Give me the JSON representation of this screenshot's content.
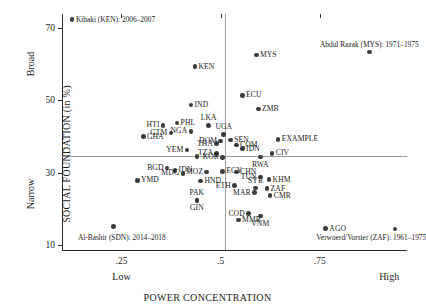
{
  "chart_data": {
    "type": "scatter",
    "title": "",
    "xlabel": "POWER CONCENTRATION",
    "ylabel": "SOCIAL FOUNDATION (in %)",
    "xlim": [
      0.1,
      0.97
    ],
    "ylim": [
      8.5,
      74.0
    ],
    "xticks": [
      ".25",
      ".5",
      ".75"
    ],
    "xtick_values": [
      0.25,
      0.5,
      0.75
    ],
    "yticks": [
      "10",
      "30",
      "50",
      "70"
    ],
    "ytick_values": [
      10,
      30,
      50,
      70
    ],
    "grid": false,
    "legend": "none",
    "x_axis_low_label": "Low",
    "x_axis_high_label": "High",
    "y_axis_low_label": "Narrow",
    "y_axis_high_label": "Broad",
    "reference_lines": {
      "vertical_x": 0.51,
      "horizontal_y": 34.5
    },
    "points": [
      {
        "label": "",
        "x": 0.125,
        "y": 72.4,
        "pos": "none"
      },
      {
        "label": "KEN",
        "x": 0.435,
        "y": 59.4,
        "pos": "right"
      },
      {
        "label": "MYS",
        "x": 0.59,
        "y": 62.6,
        "pos": "right"
      },
      {
        "label": "",
        "x": 0.875,
        "y": 63.4,
        "pos": "none"
      },
      {
        "label": "ECU",
        "x": 0.555,
        "y": 51.4,
        "pos": "right"
      },
      {
        "label": "IND",
        "x": 0.425,
        "y": 48.7,
        "pos": "right"
      },
      {
        "label": "ZMB",
        "x": 0.595,
        "y": 47.6,
        "pos": "right"
      },
      {
        "label": "PHL",
        "x": 0.39,
        "y": 43.8,
        "pos": "right"
      },
      {
        "label": "HTI",
        "x": 0.355,
        "y": 43.1,
        "pos": "left"
      },
      {
        "label": "LKA",
        "x": 0.47,
        "y": 43.0,
        "pos": "top"
      },
      {
        "label": "GTM",
        "x": 0.375,
        "y": 41.0,
        "pos": "left"
      },
      {
        "label": "NGA",
        "x": 0.425,
        "y": 41.4,
        "pos": "left"
      },
      {
        "label": "UGA",
        "x": 0.508,
        "y": 40.5,
        "pos": "top"
      },
      {
        "label": "GHA",
        "x": 0.305,
        "y": 40.0,
        "pos": "right"
      },
      {
        "label": "DOM",
        "x": 0.5,
        "y": 38.7,
        "pos": "left"
      },
      {
        "label": "SEN",
        "x": 0.525,
        "y": 39.0,
        "pos": "right"
      },
      {
        "label": "THA",
        "x": 0.49,
        "y": 38.0,
        "pos": "left"
      },
      {
        "label": "COM",
        "x": 0.54,
        "y": 37.6,
        "pos": "right"
      },
      {
        "label": "EXAMPLE",
        "x": 0.645,
        "y": 39.2,
        "pos": "right"
      },
      {
        "label": "IDN",
        "x": 0.555,
        "y": 36.6,
        "pos": "right"
      },
      {
        "label": "YEM",
        "x": 0.415,
        "y": 36.2,
        "pos": "left"
      },
      {
        "label": "TZA",
        "x": 0.49,
        "y": 35.3,
        "pos": "left"
      },
      {
        "label": "CIV",
        "x": 0.63,
        "y": 35.3,
        "pos": "right"
      },
      {
        "label": "KOR",
        "x": 0.505,
        "y": 34.2,
        "pos": "left"
      },
      {
        "label": "RWA",
        "x": 0.6,
        "y": 34.3,
        "pos": "bottom"
      },
      {
        "label": "",
        "x": 0.44,
        "y": 34.4,
        "pos": "none"
      },
      {
        "label": "BGD",
        "x": 0.365,
        "y": 31.3,
        "pos": "left"
      },
      {
        "label": "IDN",
        "x": 0.385,
        "y": 30.6,
        "pos": "right"
      },
      {
        "label": "MDG",
        "x": 0.405,
        "y": 29.8,
        "pos": "left"
      },
      {
        "label": "EGY",
        "x": 0.505,
        "y": 30.3,
        "pos": "right"
      },
      {
        "label": "CHN",
        "x": 0.54,
        "y": 30.2,
        "pos": "right"
      },
      {
        "label": "MOZ",
        "x": 0.465,
        "y": 30.1,
        "pos": "left"
      },
      {
        "label": "YMD",
        "x": 0.29,
        "y": 27.8,
        "pos": "right"
      },
      {
        "label": "HND",
        "x": 0.45,
        "y": 27.6,
        "pos": "right"
      },
      {
        "label": "TUN",
        "x": 0.6,
        "y": 28.8,
        "pos": "left"
      },
      {
        "label": "KHM",
        "x": 0.622,
        "y": 28.0,
        "pos": "right"
      },
      {
        "label": "ETH",
        "x": 0.535,
        "y": 26.4,
        "pos": "left"
      },
      {
        "label": "SYR",
        "x": 0.588,
        "y": 25.7,
        "pos": "top"
      },
      {
        "label": "ZAF",
        "x": 0.617,
        "y": 25.5,
        "pos": "right"
      },
      {
        "label": "MAR",
        "x": 0.585,
        "y": 24.4,
        "pos": "left"
      },
      {
        "label": "CMR",
        "x": 0.625,
        "y": 23.6,
        "pos": "right"
      },
      {
        "label": "PAK",
        "x": 0.44,
        "y": 22.3,
        "pos": "top"
      },
      {
        "label": "GIN",
        "x": 0.44,
        "y": 22.3,
        "pos": "bottom"
      },
      {
        "label": "COD",
        "x": 0.57,
        "y": 18.6,
        "pos": "left"
      },
      {
        "label": "MMR",
        "x": 0.545,
        "y": 16.8,
        "pos": "right"
      },
      {
        "label": "VNM",
        "x": 0.6,
        "y": 17.9,
        "pos": "bottom"
      },
      {
        "label": "AGO",
        "x": 0.765,
        "y": 14.4,
        "pos": "right"
      },
      {
        "label": "",
        "x": 0.94,
        "y": 14.3,
        "pos": "none"
      },
      {
        "label": "",
        "x": 0.23,
        "y": 15.1,
        "pos": "none"
      }
    ],
    "annotations": [
      {
        "id": "kibaki",
        "text": "Kibaki (KEN): 2006–2007",
        "x": 0.125,
        "y": 72.4,
        "align": "right"
      },
      {
        "id": "razak",
        "text": "Abdul Razak (MYS): 1971–1975",
        "x": 0.875,
        "y": 63.4,
        "align": "above-center"
      },
      {
        "id": "bashir",
        "text": "Al-Bashir (SDN): 2014–2018",
        "x": 0.13,
        "y": 11.8,
        "align": "right"
      },
      {
        "id": "verwoerd",
        "text": "Verwoerd/Vorster (ZAF): 1961–1975",
        "x": 0.88,
        "y": 11.8,
        "align": "center"
      }
    ],
    "colors": {
      "point": "#3b3b3b",
      "axis": "#2b2b2b",
      "reference_line": "#9a9a9a",
      "text": "#1a1a1a",
      "background": "#ffffff"
    }
  }
}
